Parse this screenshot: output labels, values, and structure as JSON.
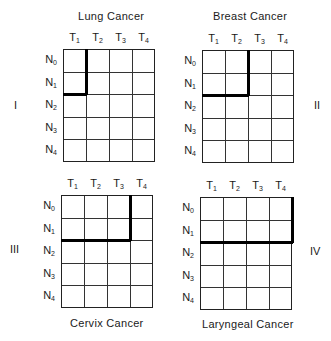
{
  "figure": {
    "columns": [
      "T1",
      "T2",
      "T3",
      "T4"
    ],
    "rows": [
      "N0",
      "N1",
      "N2",
      "N3",
      "N4"
    ],
    "panels": [
      {
        "roman": "I",
        "title": "Lung Cancer",
        "boundary": {
          "t_cols": 1,
          "n_rows": 2
        }
      },
      {
        "roman": "II",
        "title": "Breast Cancer",
        "boundary": {
          "t_cols": 2,
          "n_rows": 2
        }
      },
      {
        "roman": "III",
        "title": "Cervix Cancer",
        "boundary": {
          "t_cols": 3,
          "n_rows": 2
        }
      },
      {
        "roman": "IV",
        "title": "Laryngeal Cancer",
        "boundary": {
          "t_cols": 4,
          "n_rows": 2
        }
      }
    ]
  },
  "labels": {
    "T": "T",
    "N": "N",
    "sub": [
      "1",
      "2",
      "3",
      "4",
      "0"
    ]
  }
}
